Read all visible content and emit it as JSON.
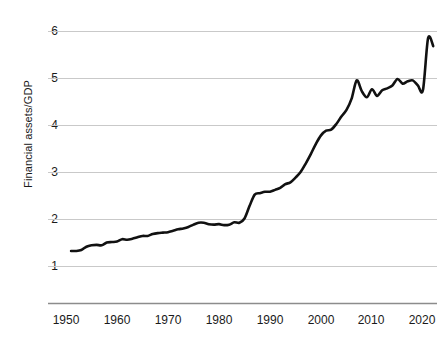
{
  "chart_data": {
    "type": "line",
    "title": "",
    "subtitle": "",
    "xlabel": "",
    "ylabel": "Financial assets/GDP",
    "xlim": [
      1948,
      2023
    ],
    "ylim": [
      0.55,
      6.25
    ],
    "grid": true,
    "grid_axis": "y",
    "legend": null,
    "line_color": "#111111",
    "grid_color": "#c9c9c9",
    "axis_color": "#8c8c8c",
    "background": "#ffffff",
    "y_ticks": [
      1,
      2,
      3,
      4,
      5,
      6
    ],
    "y_tick_labels": [
      "1",
      "2",
      "3",
      "4",
      "5",
      "6"
    ],
    "x_ticks": [
      1950,
      1960,
      1970,
      1980,
      1990,
      2000,
      2010,
      2020
    ],
    "x_tick_labels": [
      "1950",
      "1960",
      "1970",
      "1980",
      "1990",
      "2000",
      "2010",
      "2020"
    ],
    "series": [
      {
        "name": "Financial assets/GDP",
        "x": [
          1951,
          1952,
          1953,
          1954,
          1955,
          1956,
          1957,
          1958,
          1959,
          1960,
          1961,
          1962,
          1963,
          1964,
          1965,
          1966,
          1967,
          1968,
          1969,
          1970,
          1971,
          1972,
          1973,
          1974,
          1975,
          1976,
          1977,
          1978,
          1979,
          1980,
          1981,
          1982,
          1983,
          1984,
          1985,
          1986,
          1987,
          1988,
          1989,
          1990,
          1991,
          1992,
          1993,
          1994,
          1995,
          1996,
          1997,
          1998,
          1999,
          2000,
          2001,
          2002,
          2003,
          2004,
          2005,
          2006,
          2007,
          2008,
          2009,
          2010,
          2011,
          2012,
          2013,
          2014,
          2015,
          2016,
          2017,
          2018,
          2019,
          2020,
          2021,
          2022
        ],
        "y": [
          1.32,
          1.32,
          1.34,
          1.41,
          1.44,
          1.45,
          1.44,
          1.5,
          1.51,
          1.52,
          1.57,
          1.56,
          1.58,
          1.61,
          1.64,
          1.64,
          1.68,
          1.7,
          1.71,
          1.72,
          1.75,
          1.78,
          1.8,
          1.83,
          1.88,
          1.92,
          1.92,
          1.89,
          1.88,
          1.89,
          1.87,
          1.88,
          1.93,
          1.92,
          2.01,
          2.28,
          2.52,
          2.55,
          2.58,
          2.58,
          2.62,
          2.66,
          2.74,
          2.78,
          2.88,
          3.0,
          3.18,
          3.38,
          3.6,
          3.78,
          3.88,
          3.9,
          4.02,
          4.18,
          4.32,
          4.56,
          4.95,
          4.72,
          4.59,
          4.76,
          4.62,
          4.74,
          4.78,
          4.84,
          4.98,
          4.88,
          4.93,
          4.95,
          4.84,
          4.75,
          5.85,
          5.68
        ]
      }
    ],
    "annotations": []
  },
  "axis": {
    "y_label_text": "Financial assets/GDP"
  }
}
